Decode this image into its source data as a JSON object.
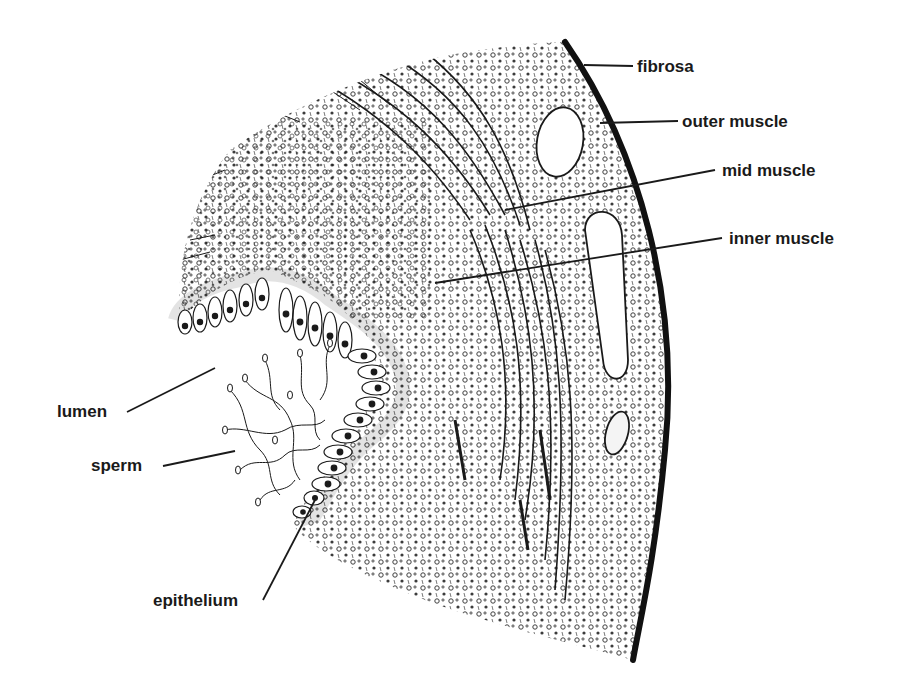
{
  "figure": {
    "ink_color": "#1a1a1a",
    "background_color": "#ffffff"
  },
  "labels": {
    "fibrosa": "fibrosa",
    "outer_muscle": "outer muscle",
    "mid_muscle": "mid muscle",
    "inner_muscle": "inner muscle",
    "lumen": "lumen",
    "sperm": "sperm",
    "epithelium": "epithelium"
  },
  "leader_lines": [
    {
      "label": "fibrosa",
      "from": [
        633,
        66
      ],
      "to": [
        584,
        65
      ]
    },
    {
      "label": "outer muscle",
      "from": [
        678,
        121
      ],
      "to": [
        600,
        123
      ]
    },
    {
      "label": "mid muscle",
      "from": [
        715,
        170
      ],
      "to": [
        505,
        210
      ]
    },
    {
      "label": "inner muscle",
      "from": [
        722,
        238
      ],
      "to": [
        435,
        283
      ]
    },
    {
      "label": "lumen",
      "from": [
        127,
        412
      ],
      "to": [
        215,
        368
      ]
    },
    {
      "label": "sperm",
      "from": [
        163,
        466
      ],
      "to": [
        235,
        451
      ]
    },
    {
      "label": "epithelium",
      "from": [
        263,
        600
      ],
      "to": [
        315,
        500
      ]
    }
  ]
}
